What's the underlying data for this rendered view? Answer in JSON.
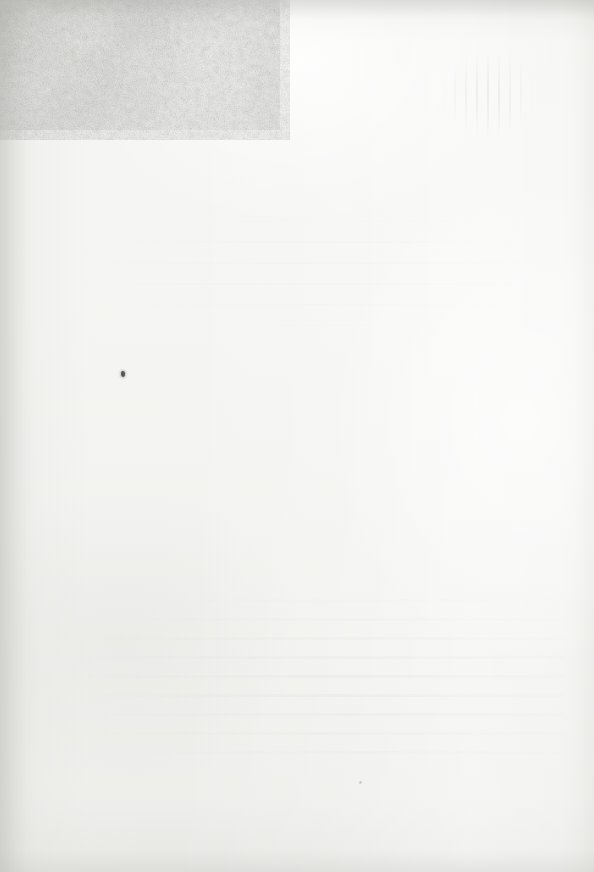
{
  "page": {
    "kind": "scanned-blank-page",
    "width": 594,
    "height": 872,
    "text_content": "",
    "visible_text_count": 0,
    "orientation": "portrait"
  },
  "paper": {
    "base_color": "#f5f5f3",
    "highlight_color": "#fdfdfc",
    "shadow_color": "#dcdcd8",
    "texture": "fibrous-mottled-grain",
    "finish": "uncoated"
  },
  "tone": {
    "top_edge_color": "#c4c4c0",
    "left_edge_color": "#c6c6c2",
    "bright_bloom_color": "#ffffff",
    "bright_bloom_x": 300,
    "bright_bloom_y": 60,
    "vignette_color": "#bebeba"
  },
  "artifacts": {
    "ghost_streaks": {
      "label": "show-through vertical streaks",
      "x": 440,
      "y": 52,
      "width": 96,
      "height": 84,
      "color": "#d0d0cc"
    },
    "ghost_lines_lower": {
      "label": "show-through text banding",
      "x": 30,
      "y": 590,
      "width": 534,
      "height": 180,
      "color": "#d2d2ce"
    },
    "ghost_lines_middle": {
      "label": "show-through text banding",
      "x": 40,
      "y": 210,
      "width": 500,
      "height": 120,
      "color": "#d4d4d0"
    },
    "specks": [
      {
        "label": "ink speck",
        "x": 121,
        "y": 371,
        "color": "#4a4a48"
      },
      {
        "label": "faint speck",
        "x": 359,
        "y": 781,
        "color": "#b6b6b2"
      }
    ]
  }
}
